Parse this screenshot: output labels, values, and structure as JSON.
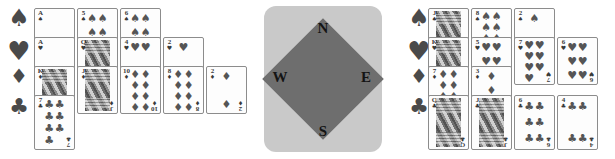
{
  "app": {
    "title": "Bridge Hand Display",
    "background_color": "#ffffff"
  },
  "suit_rail": {
    "suits": [
      {
        "key": "spades",
        "glyph": "♠",
        "name": "spade-suit-icon"
      },
      {
        "key": "hearts",
        "glyph": "♥",
        "name": "heart-suit-icon"
      },
      {
        "key": "diamonds",
        "glyph": "♦",
        "name": "diamond-suit-icon"
      },
      {
        "key": "clubs",
        "glyph": "♣",
        "name": "club-suit-icon"
      }
    ],
    "color": "#4a4a4a"
  },
  "compass": {
    "north_label": "N",
    "east_label": "E",
    "south_label": "S",
    "west_label": "W",
    "panel_color": "#c9c9c9",
    "diamond_color": "#6e6e6e",
    "label_color": "#141414"
  },
  "hands": {
    "left": {
      "name": "west-hand",
      "rows": [
        {
          "suit": "spades",
          "glyph": "♠",
          "cards": [
            {
              "rank": "A",
              "pips": 1,
              "court": false
            },
            {
              "rank": "5",
              "pips": 5,
              "court": false
            },
            {
              "rank": "6",
              "pips": 6,
              "court": false
            }
          ]
        },
        {
          "suit": "hearts",
          "glyph": "♥",
          "cards": [
            {
              "rank": "A",
              "pips": 1,
              "court": false
            },
            {
              "rank": "Q",
              "pips": 0,
              "court": true
            },
            {
              "rank": "4",
              "pips": 4,
              "court": false
            },
            {
              "rank": "2",
              "pips": 2,
              "court": false
            }
          ]
        },
        {
          "suit": "diamonds",
          "glyph": "♦",
          "cards": [
            {
              "rank": "K",
              "pips": 0,
              "court": true
            },
            {
              "rank": "J",
              "pips": 0,
              "court": true
            },
            {
              "rank": "10",
              "pips": 10,
              "court": false
            },
            {
              "rank": "8",
              "pips": 8,
              "court": false
            },
            {
              "rank": "2",
              "pips": 2,
              "court": false
            }
          ]
        },
        {
          "suit": "clubs",
          "glyph": "♣",
          "cards": [
            {
              "rank": "7",
              "pips": 7,
              "court": false
            }
          ]
        }
      ]
    },
    "right": {
      "name": "east-hand",
      "rows": [
        {
          "suit": "spades",
          "glyph": "♠",
          "cards": [
            {
              "rank": "J",
              "pips": 0,
              "court": true
            },
            {
              "rank": "8",
              "pips": 8,
              "court": false
            },
            {
              "rank": "2",
              "pips": 2,
              "court": false
            }
          ]
        },
        {
          "suit": "hearts",
          "glyph": "♥",
          "cards": [
            {
              "rank": "K",
              "pips": 0,
              "court": true
            },
            {
              "rank": "5",
              "pips": 5,
              "court": false
            },
            {
              "rank": "7",
              "pips": 7,
              "court": false
            },
            {
              "rank": "6",
              "pips": 6,
              "court": false
            }
          ]
        },
        {
          "suit": "diamonds",
          "glyph": "♦",
          "cards": [
            {
              "rank": "7",
              "pips": 7,
              "court": false
            },
            {
              "rank": "3",
              "pips": 3,
              "court": false
            }
          ]
        },
        {
          "suit": "clubs",
          "glyph": "♣",
          "cards": [
            {
              "rank": "Q",
              "pips": 0,
              "court": true
            },
            {
              "rank": "J",
              "pips": 0,
              "court": true
            },
            {
              "rank": "6",
              "pips": 6,
              "court": false
            },
            {
              "rank": "4",
              "pips": 4,
              "court": false
            }
          ]
        }
      ]
    }
  },
  "layout": {
    "left_origin_x": 34,
    "right_origin_x": 428,
    "row_tops": [
      8,
      37,
      66,
      95
    ],
    "row_heights": [
      48,
      48,
      48,
      55
    ],
    "card_width": 41,
    "card_gap": 2
  }
}
